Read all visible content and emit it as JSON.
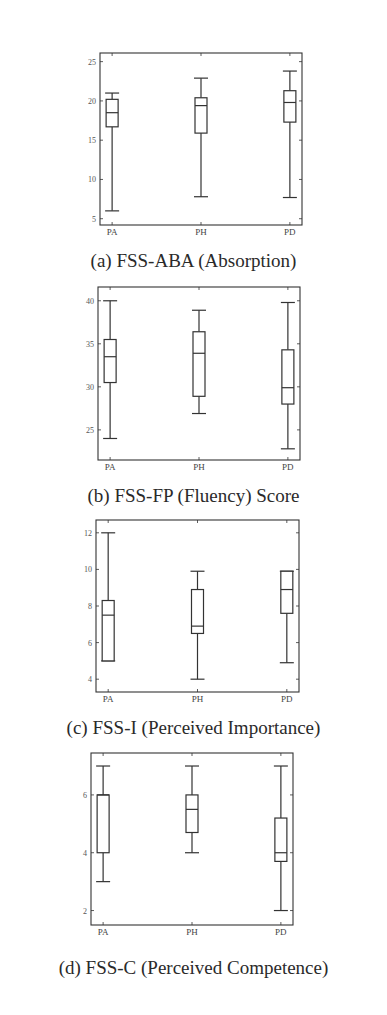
{
  "chart_data": [
    {
      "type": "boxplot",
      "title": "",
      "caption": "(a) FSS-ABA (Absorption)",
      "categories": [
        "PA",
        "PH",
        "PD"
      ],
      "yticks": [
        5,
        10,
        15,
        20,
        25
      ],
      "ylim": [
        4.2,
        26.1
      ],
      "grid": false,
      "series": [
        {
          "name": "PA",
          "min": 6.0,
          "q1": 16.7,
          "median": 18.5,
          "q3": 20.2,
          "max": 21.0
        },
        {
          "name": "PH",
          "min": 7.8,
          "q1": 15.9,
          "median": 19.4,
          "q3": 20.4,
          "max": 22.9
        },
        {
          "name": "PD",
          "min": 7.7,
          "q1": 17.3,
          "median": 19.8,
          "q3": 21.3,
          "max": 23.8
        }
      ],
      "frame": {
        "top": 53,
        "left": 100,
        "right": 302,
        "bottom": 225
      }
    },
    {
      "type": "boxplot",
      "title": "",
      "caption": "(b) FSS-FP (Fluency) Score",
      "categories": [
        "PA",
        "PH",
        "PD"
      ],
      "yticks": [
        25,
        30,
        35,
        40
      ],
      "ylim": [
        21.5,
        41.6
      ],
      "grid": false,
      "series": [
        {
          "name": "PA",
          "min": 24.0,
          "q1": 30.5,
          "median": 33.5,
          "q3": 35.5,
          "max": 40.0
        },
        {
          "name": "PH",
          "min": 26.9,
          "q1": 28.9,
          "median": 33.9,
          "q3": 36.4,
          "max": 38.9
        },
        {
          "name": "PD",
          "min": 22.8,
          "q1": 28.0,
          "median": 29.9,
          "q3": 34.3,
          "max": 39.8
        }
      ],
      "frame": {
        "top": 287,
        "left": 98,
        "right": 300,
        "bottom": 460
      }
    },
    {
      "type": "boxplot",
      "title": "",
      "caption": "(c) FSS-I (Perceived Importance)",
      "categories": [
        "PA",
        "PH",
        "PD"
      ],
      "yticks": [
        4,
        6,
        8,
        10,
        12
      ],
      "ylim": [
        3.3,
        12.7
      ],
      "grid": false,
      "series": [
        {
          "name": "PA",
          "min": 5.0,
          "q1": 5.0,
          "median": 7.5,
          "q3": 8.3,
          "max": 12.0
        },
        {
          "name": "PH",
          "min": 4.0,
          "q1": 6.5,
          "median": 6.9,
          "q3": 8.9,
          "max": 9.9
        },
        {
          "name": "PD",
          "min": 4.9,
          "q1": 7.6,
          "median": 8.9,
          "q3": 9.9,
          "max": 9.9
        }
      ],
      "frame": {
        "top": 520,
        "left": 96,
        "right": 299,
        "bottom": 692
      }
    },
    {
      "type": "boxplot",
      "title": "",
      "caption": "(d) FSS-C (Perceived Competence)",
      "categories": [
        "PA",
        "PH",
        "PD"
      ],
      "yticks": [
        2,
        4,
        6
      ],
      "ylim": [
        1.5,
        7.45
      ],
      "grid": false,
      "series": [
        {
          "name": "PA",
          "min": 3.0,
          "q1": 4.0,
          "median": 6.0,
          "q3": 6.0,
          "max": 7.0
        },
        {
          "name": "PH",
          "min": 4.0,
          "q1": 4.7,
          "median": 5.5,
          "q3": 6.0,
          "max": 7.0
        },
        {
          "name": "PD",
          "min": 2.0,
          "q1": 3.7,
          "median": 4.0,
          "q3": 5.2,
          "max": 7.0
        }
      ],
      "frame": {
        "top": 753,
        "left": 91,
        "right": 293,
        "bottom": 925
      }
    }
  ],
  "captions": {
    "a": "(a) FSS-ABA (Absorption)",
    "b": "(b) FSS-FP (Fluency) Score",
    "c": "(c) FSS-I (Perceived Importance)",
    "d": "(d) FSS-C (Perceived Competence)"
  },
  "colors": {
    "line": "#333333",
    "background": "#ffffff",
    "text": "#2a2a2a"
  }
}
